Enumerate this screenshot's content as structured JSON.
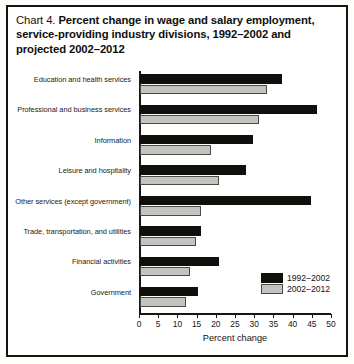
{
  "chart_data": {
    "type": "bar",
    "orientation": "horizontal",
    "title": "Chart 4.  Percent change in wage and salary employment, service-providing industry divisions, 1992–2002 and projected 2002–2012",
    "title_prefix": "Chart 4.",
    "title_main": "Percent change in wage and salary employment, service-providing industry divisions, 1992–2002 and projected 2002–2012",
    "xlabel": "Percent change",
    "ylabel": "",
    "xlim": [
      0,
      50
    ],
    "xticks": [
      0,
      5,
      10,
      15,
      20,
      25,
      30,
      35,
      40,
      45,
      50
    ],
    "xtick_labels": [
      "0",
      "5",
      "10",
      "15",
      "20",
      "25",
      "30",
      "35",
      "40",
      "45",
      "50"
    ],
    "grid": false,
    "legend_position": "lower right",
    "categories": [
      "Education and health services",
      "Professional and business services",
      "Information",
      "Leisure and hospitality",
      "Other services (except government)",
      "Trade, transportation, and utilities",
      "Financial activities",
      "Government"
    ],
    "series": [
      {
        "name": "1992–2002",
        "color": "#100f0c",
        "values": [
          37,
          46,
          29.5,
          27.5,
          44.5,
          16,
          20.5,
          15
        ]
      },
      {
        "name": "2002–2012",
        "color": "#c3c3c0",
        "values": [
          33,
          31,
          18.5,
          20.5,
          16,
          14.5,
          13,
          12
        ]
      }
    ]
  }
}
